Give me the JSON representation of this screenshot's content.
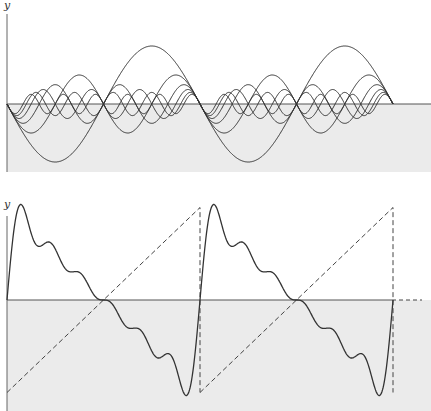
{
  "figure": {
    "colors": {
      "background": "#ffffff",
      "shade": "#ebebeb",
      "curve": "#333333",
      "axis": "#555555",
      "dashed": "#444444"
    }
  },
  "top_panel": {
    "y_axis_label": "y",
    "harmonic_count": 6,
    "period_px": 193,
    "periods_shown": 2,
    "curves": [
      {
        "n": 1,
        "amplitude_ratio": "1"
      },
      {
        "n": 2,
        "amplitude_ratio": "1/2"
      },
      {
        "n": 3,
        "amplitude_ratio": "1/3"
      },
      {
        "n": 4,
        "amplitude_ratio": "1/4"
      },
      {
        "n": 5,
        "amplitude_ratio": "1/5"
      },
      {
        "n": 6,
        "amplitude_ratio": "1/6"
      }
    ]
  },
  "bottom_panel": {
    "y_axis_label": "y",
    "partial_sum_terms": 6,
    "target_wave": "sawtooth (dashed)",
    "periods_shown": 2
  }
}
